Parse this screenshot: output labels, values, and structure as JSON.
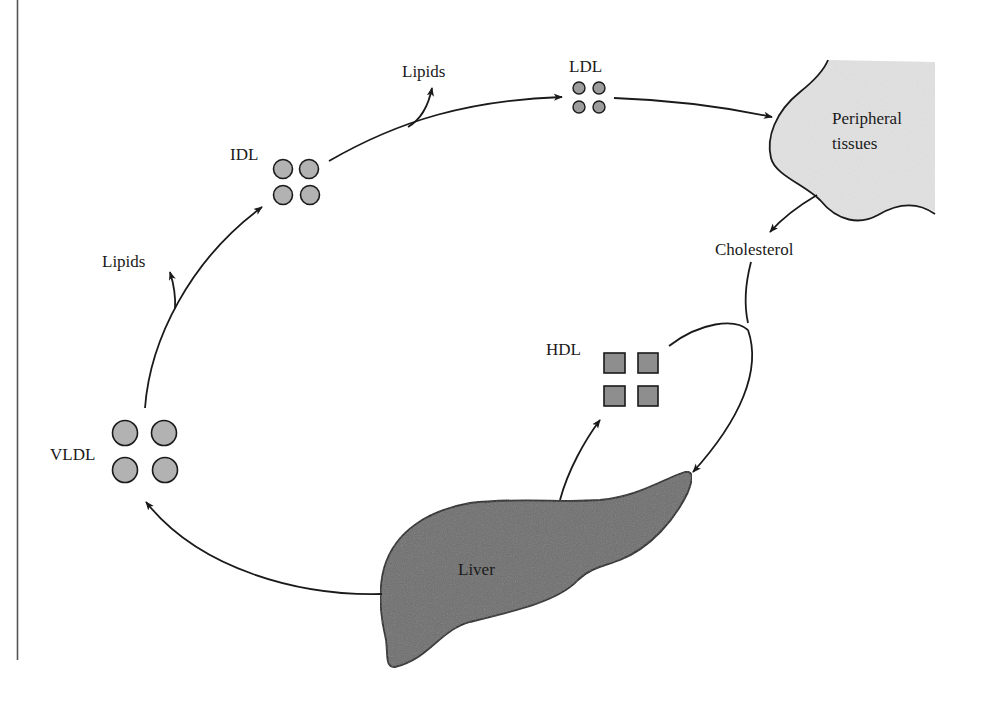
{
  "diagram": {
    "colors": {
      "liver": "#6e6e6e",
      "peripheral": "#e2e2e2",
      "vldl_particle": "#b2b2b2",
      "idl_particle": "#b2b2b2",
      "ldl_particle": "#9c9c9c",
      "hdl_particle": "#8e8e8e",
      "stroke": "#1a1a1a"
    },
    "nodes": {
      "liver": {
        "label": "Liver"
      },
      "peripheral": {
        "label_line1": "Peripheral",
        "label_line2": "tissues"
      },
      "vldl": {
        "label": "VLDL",
        "shape": "circle",
        "count": 4
      },
      "idl": {
        "label": "IDL",
        "shape": "circle",
        "count": 4
      },
      "ldl": {
        "label": "LDL",
        "shape": "circle",
        "count": 4
      },
      "hdl": {
        "label": "HDL",
        "shape": "square",
        "count": 4
      },
      "lipids_1": {
        "label": "Lipids"
      },
      "lipids_2": {
        "label": "Lipids"
      },
      "cholesterol": {
        "label": "Cholesterol"
      }
    },
    "edges": [
      {
        "from": "Liver",
        "to": "VLDL"
      },
      {
        "from": "VLDL",
        "to": "IDL"
      },
      {
        "from": "VLDL",
        "to": "Lipids"
      },
      {
        "from": "IDL",
        "to": "LDL"
      },
      {
        "from": "IDL",
        "to": "Lipids"
      },
      {
        "from": "LDL",
        "to": "Peripheral tissues"
      },
      {
        "from": "Peripheral tissues",
        "to": "Cholesterol"
      },
      {
        "from": "Cholesterol",
        "to": "Liver"
      },
      {
        "from": "HDL",
        "to": "Liver"
      },
      {
        "from": "Liver",
        "to": "HDL"
      }
    ]
  }
}
